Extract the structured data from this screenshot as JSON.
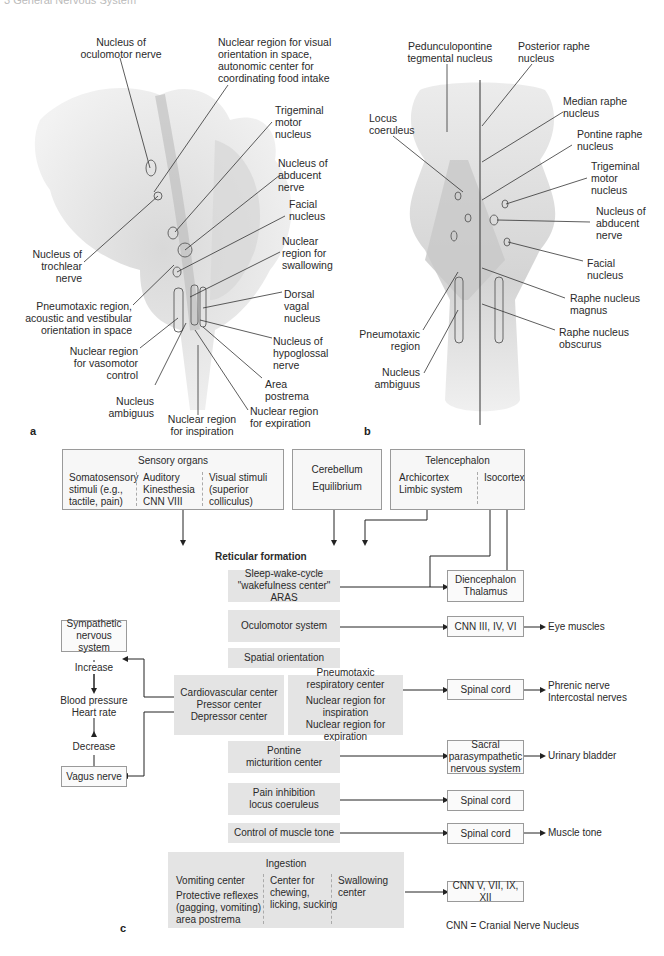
{
  "header": {
    "running_title": "3 General Nervous System"
  },
  "panel_a": {
    "letter": "a",
    "labels": {
      "oculomotor": "Nucleus of\noculomotor nerve",
      "visual_orientation": "Nuclear region for visual\norientation in space,\nautonomic center for\ncoordinating food intake",
      "trigeminal_motor": "Trigeminal\nmotor\nnucleus",
      "abducent": "Nucleus of\nabducent\nnerve",
      "facial": "Facial\nnucleus",
      "trochlear": "Nucleus of\ntrochlear\nnerve",
      "swallowing": "Nuclear\nregion for\nswallowing",
      "pneumotaxic": "Pneumotaxic region,\nacoustic and vestibular\norientation in space",
      "dorsal_vagal": "Dorsal\nvagal\nnucleus",
      "vasomotor": "Nuclear region\nfor vasomotor\ncontrol",
      "hypoglossal": "Nucleus of\nhypoglossal\nnerve",
      "ambiguus": "Nucleus\nambiguus",
      "area_postrema": "Area\npostrema",
      "inspiration": "Nuclear region\nfor inspiration",
      "expiration": "Nuclear region\nfor expiration"
    }
  },
  "panel_b": {
    "letter": "b",
    "labels": {
      "pedunculopontine": "Pedunculopontine\ntegmental nucleus",
      "posterior_raphe": "Posterior raphe\nnucleus",
      "locus_coeruleus": "Locus\ncoeruleus",
      "median_raphe": "Median raphe\nnucleus",
      "pontine_raphe": "Pontine raphe\nnucleus",
      "trigeminal_motor": "Trigeminal\nmotor\nnucleus",
      "abducent": "Nucleus of\nabducent\nnerve",
      "facial": "Facial\nnucleus",
      "raphe_magnus": "Raphe nucleus\nmagnus",
      "pneumotaxic": "Pneumotaxic\nregion",
      "raphe_obscurus": "Raphe nucleus\nobscurus",
      "ambiguus": "Nucleus\nambiguus"
    }
  },
  "panel_c": {
    "letter": "c",
    "title": "Reticular formation",
    "inputs": {
      "sensory": {
        "title": "Sensory organs",
        "col1": "Somatosensory\nstimuli (e.g.,\ntactile, pain)",
        "col2": "Auditory\nKinesthesia\nCNN VIII",
        "col3": "Visual stimuli\n(superior colliculus)"
      },
      "cerebellum": {
        "line1": "Cerebellum",
        "line2": "Equilibrium"
      },
      "telencephalon": {
        "title": "Telencephalon",
        "col1": "Archicortex\nLimbic system",
        "col2": "Isocortex"
      }
    },
    "centers": {
      "sleep_wake": "Sleep-wake-cycle\n\"wakefulness center\" ARAS",
      "oculomotor": "Oculomotor system",
      "spatial": "Spatial orientation",
      "cardiovascular": "Cardiovascular center\nPressor center\nDepressor center",
      "pneumotaxic_top": "Pneumotaxic\nrespiratory center",
      "pneumotaxic_bottom": "Nuclear region for inspiration\nNuclear region for expiration",
      "micturition": "Pontine\nmicturition center",
      "pain": "Pain inhibition\nlocus coeruleus",
      "muscle_tone": "Control of muscle tone",
      "ingestion": {
        "title": "Ingestion",
        "col1a": "Vomiting center",
        "col1b": "Protective reflexes\n(gagging, vomiting)\narea postrema",
        "col2": "Center for\nchewing,\nlicking, sucking",
        "col3": "Swallowing\ncenter"
      }
    },
    "targets": {
      "diencephalon": "Diencephalon\nThalamus",
      "cnn_eye": "CNN III, IV, VI",
      "spinal_resp": "Spinal cord",
      "sacral": "Sacral\nparasympathetic\nnervous system",
      "spinal_pain": "Spinal cord",
      "spinal_muscle": "Spinal cord",
      "cnn_ingestion": "CNN V, VII, IX, XII"
    },
    "outputs": {
      "eye": "Eye muscles",
      "resp": "Phrenic nerve\nIntercostal nerves",
      "bladder": "Urinary bladder",
      "muscle": "Muscle tone"
    },
    "autonomic": {
      "sympathetic": "Sympathetic\nnervous system",
      "increase": "Increase",
      "bp": "Blood pressure\nHeart rate",
      "decrease": "Decrease",
      "vagus": "Vagus nerve"
    },
    "legend": "CNN = Cranial Nerve Nucleus"
  }
}
